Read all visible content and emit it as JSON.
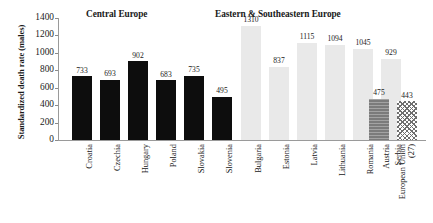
{
  "chart_data": {
    "type": "bar",
    "title": "",
    "xlabel": "",
    "ylabel": "Standardized death rate (males)",
    "ylim": [
      0,
      1400
    ],
    "yticks": [
      0,
      200,
      400,
      600,
      800,
      1000,
      1200,
      1400
    ],
    "grid": false,
    "legend": "none",
    "panels": [
      {
        "title": "Central Europe",
        "categories": [
          "Croatia",
          "Czechia",
          "Hungary",
          "Poland",
          "Slovakia",
          "Slovenia"
        ],
        "values": [
          733,
          693,
          902,
          683,
          735,
          495
        ],
        "style": "dark"
      },
      {
        "title": "Eastern & Southeastern Europe",
        "categories": [
          "Bulgaria",
          "Estonia",
          "Latvia",
          "Lithuania",
          "Romania",
          "Serbia"
        ],
        "values": [
          1310,
          837,
          1115,
          1094,
          1045,
          929
        ],
        "style": "light"
      },
      {
        "title": "",
        "categories": [
          "Austria",
          "European Union (27)"
        ],
        "values": [
          475,
          443
        ],
        "style": "reference"
      }
    ],
    "categories": [
      "Croatia",
      "Czechia",
      "Hungary",
      "Poland",
      "Slovakia",
      "Slovenia",
      "Bulgaria",
      "Estonia",
      "Latvia",
      "Lithuania",
      "Romania",
      "Serbia",
      "Austria",
      "European Union (27)"
    ],
    "values": [
      733,
      693,
      902,
      683,
      735,
      495,
      1310,
      837,
      1115,
      1094,
      1045,
      929,
      475,
      443
    ],
    "colors": {
      "central_europe_bar": "#0d0d0d",
      "eastern_europe_bar": "#e9e9e9",
      "austria_bar": "#7b7b7b",
      "eu27_bar": "#ffffff",
      "axis": "#9a9a9a",
      "text": "#1a1a1a"
    }
  },
  "bars": [
    {
      "label": "Croatia",
      "value": 733,
      "value_text": "733",
      "style": "dark",
      "x": 14,
      "label_lines": 1
    },
    {
      "label": "Czechia",
      "value": 693,
      "value_text": "693",
      "style": "dark",
      "x": 42,
      "label_lines": 1
    },
    {
      "label": "Hungary",
      "value": 902,
      "value_text": "902",
      "style": "dark",
      "x": 70,
      "label_lines": 1
    },
    {
      "label": "Poland",
      "value": 683,
      "value_text": "683",
      "style": "dark",
      "x": 98,
      "label_lines": 1
    },
    {
      "label": "Slovakia",
      "value": 735,
      "value_text": "735",
      "style": "dark",
      "x": 126,
      "label_lines": 1
    },
    {
      "label": "Slovenia",
      "value": 495,
      "value_text": "495",
      "style": "dark",
      "x": 154,
      "label_lines": 1
    },
    {
      "label": "Bulgaria",
      "value": 1310,
      "value_text": "1310",
      "style": "light",
      "x": 183,
      "label_lines": 1
    },
    {
      "label": "Estonia",
      "value": 837,
      "value_text": "837",
      "style": "light",
      "x": 211,
      "label_lines": 1
    },
    {
      "label": "Latvia",
      "value": 1115,
      "value_text": "1115",
      "style": "light",
      "x": 239,
      "label_lines": 1
    },
    {
      "label": "Lithuania",
      "value": 1094,
      "value_text": "1094",
      "style": "light",
      "x": 267,
      "label_lines": 1
    },
    {
      "label": "Romania",
      "value": 1045,
      "value_text": "1045",
      "style": "light",
      "x": 295,
      "label_lines": 1
    },
    {
      "label": "Serbia",
      "value": 929,
      "value_text": "929",
      "style": "light",
      "x": 323,
      "label_lines": 1
    },
    {
      "label": "Austria",
      "value": 475,
      "value_text": "475",
      "style": "gray",
      "x": 311,
      "label_lines": 1
    },
    {
      "label": "European Union (27)",
      "value": 443,
      "value_text": "443",
      "style": "hatch",
      "x": 339,
      "label_lines": 2
    }
  ],
  "axis": {
    "ticks": [
      "1400",
      "1200",
      "1000",
      "800",
      "600",
      "400",
      "200",
      "0"
    ],
    "title": "Standardized death rate (males)"
  },
  "titles": {
    "central": "Central Europe",
    "eastern": "Eastern & Southeastern Europe"
  }
}
